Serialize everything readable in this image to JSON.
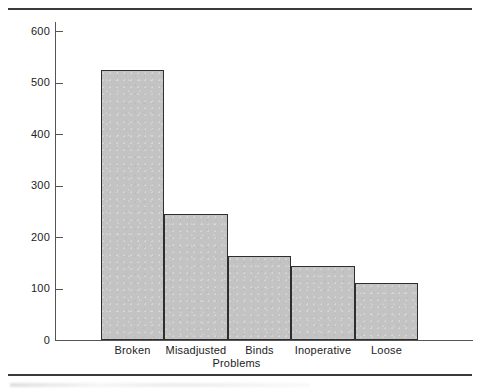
{
  "chart_data": {
    "type": "bar",
    "title": "",
    "xlabel": "Problems",
    "ylabel": "Cases",
    "categories": [
      "Broken",
      "Misadjusted",
      "Binds",
      "Inoperative",
      "Loose"
    ],
    "values": [
      525,
      245,
      163,
      144,
      111
    ],
    "ylim": [
      0,
      620
    ],
    "yticks": [
      0,
      100,
      200,
      300,
      400,
      500,
      600
    ],
    "ytick_labels": [
      "0",
      "100",
      "200",
      "300",
      "400",
      "500",
      "600"
    ],
    "grid": false,
    "legend": false,
    "bar_fill_color": "#c3c3c3",
    "bar_edge_color": "#2e2e2e",
    "axis_color": "#555555",
    "rule_color": "#3a3a3a"
  },
  "figure": {
    "top_rule": "",
    "bottom_rule": ""
  }
}
